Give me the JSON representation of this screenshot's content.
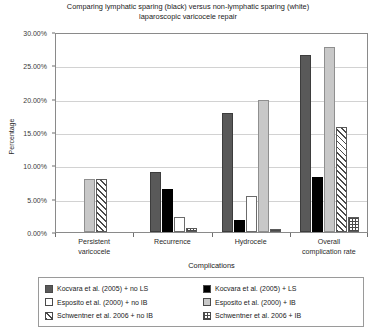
{
  "chart_data": {
    "type": "bar",
    "title": "Comparing lymphatic sparing (black) versus non-lymphatic sparing (white) laparoscopic varicocele repair",
    "title_lines": [
      "Comparing lymphatic sparing (black) versus non-lymphatic sparing (white)",
      "laparoscopic varicocele repair"
    ],
    "xlabel": "Complications",
    "ylabel": "Percentage",
    "ylim": [
      0,
      30
    ],
    "ytick_labels": [
      "0.00%",
      "5.00%",
      "10.00%",
      "15.00%",
      "20.00%",
      "25.00%",
      "30.00%"
    ],
    "ytick_values": [
      0,
      5,
      10,
      15,
      20,
      25,
      30
    ],
    "grid": true,
    "legend_position": "bottom",
    "categories": [
      "Persistent varicocele",
      "Recurrence",
      "Hydrocele",
      "Overall complication rate"
    ],
    "category_lines": [
      [
        "Persistent",
        "varicocele"
      ],
      [
        "Recurrence"
      ],
      [
        "Hydrocele"
      ],
      [
        "Overall",
        "complication rate"
      ]
    ],
    "series": [
      {
        "name": "Kocvara et al. (2005) + no LS",
        "fill": "darkgray",
        "color": "#595959",
        "values": [
          0,
          9.0,
          17.8,
          26.5
        ]
      },
      {
        "name": "Kocvara et al. (2005) + LS",
        "fill": "black",
        "color": "#000000",
        "values": [
          0,
          6.5,
          1.8,
          8.3
        ]
      },
      {
        "name": "Esposito et al. (2000) + no IB",
        "fill": "white",
        "color": "#ffffff",
        "values": [
          0,
          2.3,
          5.4,
          0
        ]
      },
      {
        "name": "Esposito et al. (2000) + IB",
        "fill": "lightgray",
        "color": "#c8c8c8",
        "values": [
          8.0,
          0,
          19.8,
          27.7
        ]
      },
      {
        "name": "Schwentner et al. 2006 + no IB",
        "fill": "hatch",
        "color": "#ffffff",
        "values": [
          8.0,
          0,
          0,
          15.8
        ]
      },
      {
        "name": "Schwentner et al. 2006 + IB",
        "fill": "dots",
        "color": "#ffffff",
        "values": [
          0,
          0.6,
          0.4,
          2.2
        ]
      }
    ]
  },
  "legend": {
    "items": [
      {
        "label": "Kocvara et al. (2005) + no LS",
        "fill": "darkgray"
      },
      {
        "label": "Kocvara et al. (2005) + LS",
        "fill": "black"
      },
      {
        "label": "Esposito et al. (2000) + no IB",
        "fill": "white"
      },
      {
        "label": "Esposito et al. (2000) + IB",
        "fill": "lightgray"
      },
      {
        "label": "Schwentner et al. 2006 + no IB",
        "fill": "hatch"
      },
      {
        "label": "Schwentner et al. 2006 + IB",
        "fill": "dots"
      }
    ]
  }
}
